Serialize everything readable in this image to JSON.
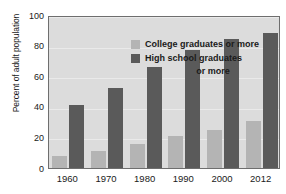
{
  "chart_data": {
    "type": "bar",
    "title": "",
    "subtitle": "",
    "xlabel": "",
    "ylabel": "Percent of adult population",
    "categories": [
      "1960",
      "1970",
      "1980",
      "1990",
      "2000",
      "2012"
    ],
    "series": [
      {
        "name": "College graduates or more",
        "color": "#b4b4b4",
        "values": [
          7.7,
          11,
          16,
          21,
          25,
          31
        ]
      },
      {
        "name": "High school graduates or more",
        "color": "#5a5a5a",
        "values": [
          41,
          52,
          66,
          77,
          84,
          88
        ]
      }
    ],
    "ylim": [
      0,
      100
    ],
    "yticks": [
      0,
      20,
      40,
      60,
      80,
      100
    ],
    "ytick_labels": [
      "0",
      "20",
      "40",
      "60",
      "80",
      "100"
    ],
    "grid": true,
    "grid_axis": "y",
    "legend_position": "inside-top-center",
    "plot_background": "#dcdcdc",
    "figure_background": "#ffffff",
    "axis_color": "#6e6e6e"
  },
  "legend": {
    "entries": [
      {
        "label": "College graduates or more",
        "color": "#b4b4b4"
      },
      {
        "label": "High school graduates",
        "label_line2": "or more",
        "color": "#5a5a5a"
      }
    ]
  },
  "axes": {
    "y_title": "Percent of adult population",
    "y_labels": [
      "100",
      "80",
      "60",
      "40",
      "20",
      "0"
    ],
    "x_labels": [
      "1960",
      "1970",
      "1980",
      "1990",
      "2000",
      "2012"
    ]
  }
}
